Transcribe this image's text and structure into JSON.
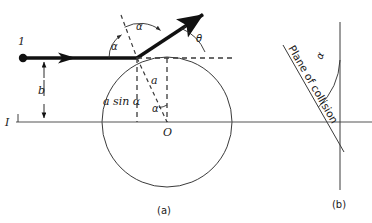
{
  "figure": {
    "panel_a_label": "(a)",
    "panel_b_label": "(b)"
  },
  "panel_a": {
    "particle_label": "1",
    "impact_parameter_label": "b",
    "axis_label": "I",
    "center_label": "O",
    "radius_label": "a",
    "vertical_offset_label": "a sin α",
    "angle_alpha_incident": "α",
    "angle_alpha_reflected": "α",
    "angle_alpha_center": "α",
    "angle_theta": "θ",
    "geometry": {
      "circle_center_x": 167,
      "circle_center_y": 122,
      "circle_radius": 65,
      "collision_point_x": 137,
      "collision_point_y": 58,
      "incident_dot_x": 22,
      "incident_dot_y": 58,
      "outgoing_tip_x": 207,
      "outgoing_tip_y": 12,
      "axis_y": 122,
      "impact_line_x": 44
    }
  },
  "panel_b": {
    "plane_of_collision_label": "Plane of collision",
    "angle_alpha": "α",
    "geometry": {
      "vertical_line_x": 340,
      "vertical_top_y": 22,
      "vertical_bottom_y": 190,
      "plane_top_x": 283,
      "plane_top_y": 45,
      "plane_bottom_x": 343,
      "plane_bottom_y": 150
    }
  },
  "colors": {
    "ink": "#111111",
    "line": "#3a3a3a",
    "axis": "#555555",
    "background": "#ffffff"
  }
}
